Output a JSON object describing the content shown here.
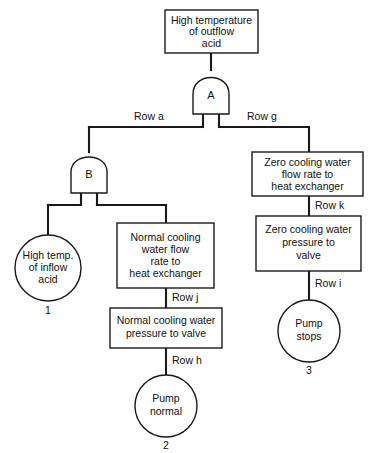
{
  "diagram": {
    "type": "fault-tree",
    "title_node": {
      "id": "top-event",
      "shape": "rectangle",
      "lines": [
        "High temperature",
        "of outflow",
        "acid"
      ]
    },
    "gates": [
      {
        "id": "gate-a",
        "label": "A",
        "shape": "and-gate"
      },
      {
        "id": "gate-b",
        "label": "B",
        "shape": "and-gate"
      }
    ],
    "row_labels": {
      "row_a": "Row a",
      "row_g": "Row g",
      "row_j": "Row j",
      "row_h": "Row h",
      "row_k": "Row k",
      "row_i": "Row i"
    },
    "nodes": {
      "high_temp_inflow": {
        "shape": "circle",
        "lines": [
          "High temp.",
          "of inflow",
          "acid"
        ],
        "number": "1"
      },
      "normal_flow_rate": {
        "shape": "rectangle",
        "lines": [
          "Normal cooling",
          "water flow",
          "rate to",
          "heat exchanger"
        ]
      },
      "normal_pressure": {
        "shape": "rectangle",
        "lines": [
          "Normal cooling water",
          "pressure to valve"
        ]
      },
      "pump_normal": {
        "shape": "circle",
        "lines": [
          "Pump",
          "normal"
        ],
        "number": "2"
      },
      "zero_flow_rate": {
        "shape": "rectangle",
        "lines": [
          "Zero cooling water",
          "flow rate to",
          "heat exchanger"
        ]
      },
      "zero_pressure": {
        "shape": "rectangle",
        "lines": [
          "Zero cooling water",
          "pressure to",
          "valve"
        ]
      },
      "pump_stops": {
        "shape": "circle",
        "lines": [
          "Pump",
          "stops"
        ],
        "number": "3"
      }
    },
    "colors": {
      "stroke": "#1a1a1a",
      "fill": "#ffffff",
      "text": "#111111"
    }
  }
}
